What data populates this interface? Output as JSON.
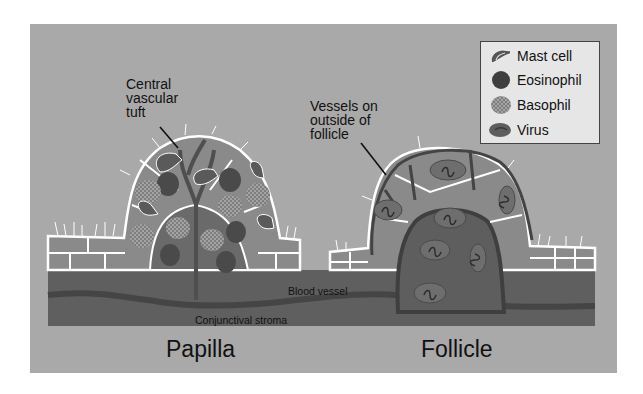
{
  "figure": {
    "labels": {
      "central_vascular_tuft": "Central\nvascular\ntuft",
      "vessels_outside_follicle": "Vessels on\noutside of\nfollicle",
      "blood_vessel": "Blood vessel",
      "conjunctival_stroma": "Conjunctival stroma",
      "papilla": "Papilla",
      "follicle": "Follicle"
    },
    "legend": {
      "items": [
        {
          "label": "Mast cell",
          "icon": "mast-cell-icon"
        },
        {
          "label": "Eosinophil",
          "icon": "eosinophil-icon"
        },
        {
          "label": "Basophil",
          "icon": "basophil-icon"
        },
        {
          "label": "Virus",
          "icon": "virus-icon"
        }
      ]
    },
    "colors": {
      "background_panel": "#a9a9a9",
      "tissue_dark": "#626262",
      "epithelium": "#8a8a8a",
      "blood_vessel": "#4a4a4a",
      "membrane": "#ffffff",
      "legend_bg": "#e6e6e6"
    }
  }
}
